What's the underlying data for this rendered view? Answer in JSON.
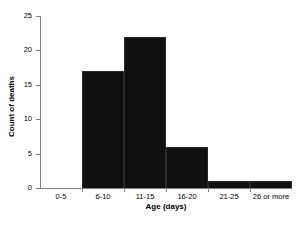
{
  "chart_data": {
    "type": "bar",
    "title": "",
    "xlabel": "Age (days)",
    "ylabel": "Count of deaths",
    "categories": [
      "0-5",
      "6-10",
      "11-15",
      "16-20",
      "21-25",
      "26 or more"
    ],
    "values": [
      0,
      17,
      22,
      6,
      1,
      1
    ],
    "ylim": [
      0,
      25
    ],
    "yticks": [
      0,
      5,
      10,
      15,
      20,
      25
    ],
    "ytick_labels": [
      "0",
      "5",
      "10",
      "15",
      "20",
      "25"
    ],
    "grid": false,
    "legend": false,
    "legend_position": "none",
    "bar_style": "histogram-adjacent",
    "series": [
      {
        "name": "Count of deaths",
        "values": [
          0,
          17,
          22,
          6,
          1,
          1
        ]
      }
    ]
  },
  "colors": {
    "bar_fill": "#111111",
    "axis_line": "#808080",
    "text": "#000000",
    "background": "#ffffff"
  },
  "footer": {
    "artifact_text": ""
  }
}
